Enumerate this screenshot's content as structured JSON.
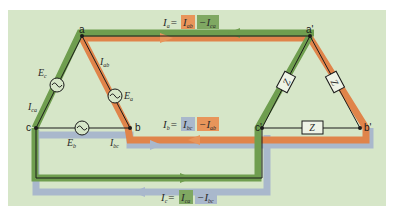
{
  "colors": {
    "background": "#d6e6c8",
    "green_path": "#6f9e4f",
    "orange_path": "#e0844a",
    "blue_path": "#9fb0c8",
    "wire": "#1a1a1a"
  },
  "nodes": {
    "a": "a",
    "b": "b",
    "c": "c",
    "a_prime": "a'",
    "b_prime": "b'",
    "c_prime": "c'"
  },
  "sources": {
    "Ec": {
      "label": "E",
      "sub": "c"
    },
    "Ea": {
      "label": "E",
      "sub": "a"
    },
    "Eb": {
      "label": "E",
      "sub": "b"
    }
  },
  "branch_currents": {
    "Ica": {
      "label": "I",
      "sub": "ca"
    },
    "Iab": {
      "label": "I",
      "sub": "ab"
    },
    "Ibc": {
      "label": "I",
      "sub": "bc"
    }
  },
  "impedances": {
    "Z1": "Z",
    "Z2": "Z",
    "Z3": "Z"
  },
  "equations": {
    "Ia": {
      "lhs": "I",
      "lhs_sub": "a",
      "eq": "=",
      "t1": "I",
      "t1_sub": "ab",
      "t2": "−I",
      "t2_sub": "ca"
    },
    "Ib": {
      "lhs": "I",
      "lhs_sub": "b",
      "eq": "=",
      "t1": "I",
      "t1_sub": "bc",
      "t2": "−I",
      "t2_sub": "ab"
    },
    "Ic": {
      "lhs": "I",
      "lhs_sub": "c",
      "eq": "=",
      "t1": "I",
      "t1_sub": "ca",
      "t2": "−I",
      "t2_sub": "bc"
    }
  }
}
